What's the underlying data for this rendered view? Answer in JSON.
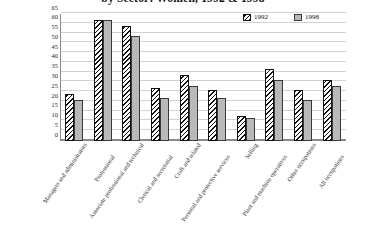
{
  "chart_data": {
    "type": "bar",
    "title": "by Sector: Women, 1992 & 1998",
    "xlabel": "",
    "ylabel": "",
    "ylim": [
      0,
      65
    ],
    "yticks": [
      0,
      5,
      10,
      15,
      20,
      25,
      30,
      35,
      40,
      45,
      50,
      55,
      60,
      65
    ],
    "grid": true,
    "legend_position": "top-right",
    "categories": [
      "Managers and administrators",
      "Professional",
      "Associate professional and technical",
      "Clerical and secretarial",
      "Craft and related",
      "Personal and protective services",
      "Selling",
      "Plant and machine operatives",
      "Other occupations",
      "All occupations"
    ],
    "series": [
      {
        "name": "1992",
        "values": [
          24,
          62,
          59,
          27,
          34,
          26,
          13,
          37,
          26,
          31
        ]
      },
      {
        "name": "1998",
        "values": [
          21,
          62,
          54,
          22,
          28,
          22,
          12,
          31,
          21,
          28
        ]
      }
    ]
  },
  "legend": {
    "items": [
      {
        "label": "1992"
      },
      {
        "label": "1998"
      }
    ]
  }
}
